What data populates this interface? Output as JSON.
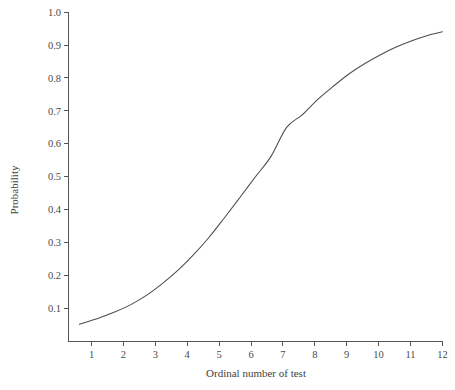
{
  "chart_data": {
    "type": "line",
    "title": "",
    "subtitle": "",
    "xlabel": "Ordinal number of test",
    "ylabel": "Probability",
    "xlim": [
      0.0,
      12.0
    ],
    "ylim": [
      0.0,
      1.0
    ],
    "grid": false,
    "legend": null,
    "xticks": [
      1,
      2,
      3,
      4,
      5,
      6,
      7,
      8,
      9,
      10,
      11,
      12
    ],
    "xtick_labels": [
      "1",
      "2",
      "3",
      "4",
      "5",
      "6",
      "7",
      "8",
      "9",
      "10",
      "11",
      "12"
    ],
    "yticks": [
      0.1,
      0.2,
      0.3,
      0.4,
      0.5,
      0.6,
      0.7,
      0.8,
      0.9,
      1.0
    ],
    "ytick_labels": [
      "0.1",
      "0.2",
      "0.3",
      "0.4",
      "0.5",
      "0.6",
      "0.7",
      "0.8",
      "0.9",
      "1.0"
    ],
    "series": [
      {
        "name": "probability",
        "x": [
          0.35,
          1.0,
          1.5,
          2.0,
          2.5,
          3.0,
          3.5,
          4.0,
          4.5,
          5.0,
          5.5,
          6.0,
          6.5,
          7.0,
          7.5,
          8.0,
          8.5,
          9.0,
          9.5,
          10.0,
          10.5,
          11.0,
          11.5,
          12.0
        ],
        "y": [
          0.052,
          0.072,
          0.09,
          0.112,
          0.14,
          0.175,
          0.215,
          0.262,
          0.315,
          0.375,
          0.437,
          0.5,
          0.562,
          0.65,
          0.688,
          0.735,
          0.775,
          0.812,
          0.843,
          0.87,
          0.893,
          0.912,
          0.928,
          0.94
        ]
      }
    ],
    "annotations": [],
    "colors": {
      "curve": "#4c4c52",
      "axis": "#55555a",
      "text": "#3f3f3f",
      "background": "#ffffff"
    }
  },
  "axes": {
    "y_axis_title": "Probability",
    "x_axis_title": "Ordinal number of test"
  }
}
